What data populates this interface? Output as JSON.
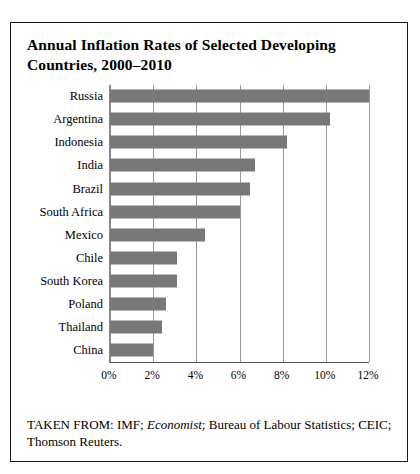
{
  "figure": {
    "title": "Annual Inflation Rates of Selected Developing Countries, 2000–2010",
    "source_prefix": "TAKEN FROM: IMF; ",
    "source_italic": "Economist",
    "source_rest": "; Bureau of Labour Statistics; CEIC; Thomson Reuters.",
    "bar_color": "#787878",
    "grid_color": "#9a9a9a",
    "border_color": "#1a1a1a"
  },
  "chart_data": {
    "type": "bar",
    "orientation": "horizontal",
    "title": "Annual Inflation Rates of Selected Developing Countries, 2000–2010",
    "xlabel": "",
    "ylabel": "",
    "categories": [
      "Russia",
      "Argentina",
      "Indonesia",
      "India",
      "Brazil",
      "South Africa",
      "Mexico",
      "Chile",
      "South Korea",
      "Poland",
      "Thailand",
      "China"
    ],
    "values": [
      12.0,
      10.2,
      8.2,
      6.7,
      6.5,
      6.0,
      4.4,
      3.1,
      3.1,
      2.6,
      2.4,
      2.0
    ],
    "value_unit": "%",
    "xlim": [
      0,
      12
    ],
    "xticks": [
      0,
      2,
      4,
      6,
      8,
      10,
      12
    ],
    "xtick_labels": [
      "0%",
      "2%",
      "4%",
      "6%",
      "8%",
      "10%",
      "12%"
    ],
    "grid": true,
    "grid_axis": "x",
    "legend": false
  }
}
